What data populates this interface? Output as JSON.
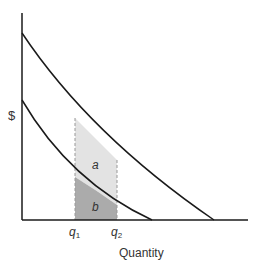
{
  "diagram": {
    "y_axis_label": "$",
    "x_axis_label": "Quantity",
    "tick_q1": "q",
    "tick_q1_sub": "1",
    "tick_q2": "q",
    "tick_q2_sub": "2",
    "region_a_label": "a",
    "region_b_label": "b",
    "colors": {
      "axis": "#1a1a1a",
      "curve": "#1a1a1a",
      "region_a_fill": "#e3e3e3",
      "region_b_fill": "#ababab",
      "dashed": "#999999"
    }
  }
}
